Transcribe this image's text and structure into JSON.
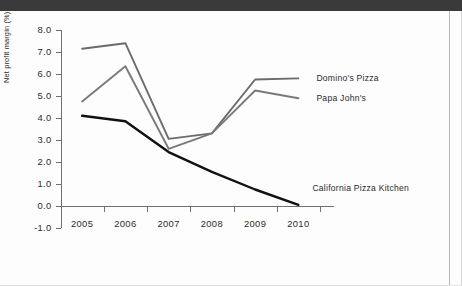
{
  "chart_data": {
    "type": "line",
    "title": "",
    "subtitle": "",
    "xlabel": "",
    "ylabel": "Net profit margin (%)",
    "categories": [
      "2005",
      "2006",
      "2007",
      "2008",
      "2009",
      "2010"
    ],
    "x": [
      2005,
      2006,
      2007,
      2008,
      2009,
      2010
    ],
    "xlim": [
      2004.6,
      2010.4
    ],
    "ylim": [
      -1.0,
      8.0
    ],
    "yticks": [
      "8.0",
      "7.0",
      "6.0",
      "5.0",
      "4.0",
      "3.0",
      "2.0",
      "1.0",
      "0.0",
      "-1.0"
    ],
    "ytick_values": [
      8.0,
      7.0,
      6.0,
      5.0,
      4.0,
      3.0,
      2.0,
      1.0,
      0.0,
      -1.0
    ],
    "grid": false,
    "legend_position": "inline-right",
    "series": [
      {
        "name": "Domino's Pizza",
        "color": "#6b6b6b",
        "values": [
          7.15,
          7.4,
          3.05,
          3.3,
          5.75,
          5.8
        ]
      },
      {
        "name": "Papa John's",
        "color": "#7a7a7a",
        "values": [
          4.75,
          6.35,
          2.6,
          3.3,
          5.25,
          4.9
        ]
      },
      {
        "name": "California Pizza Kitchen",
        "color": "#111111",
        "values": [
          4.1,
          3.85,
          2.45,
          1.55,
          0.75,
          0.05
        ]
      }
    ]
  },
  "axis": {
    "y_label": "Net profit margin (%)"
  },
  "series_labels": {
    "dominos": "Domino's Pizza",
    "papajohns": "Papa John's",
    "cpk": "California Pizza Kitchen"
  }
}
